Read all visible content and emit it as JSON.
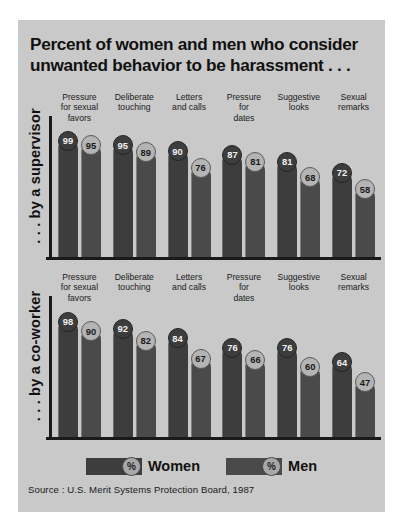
{
  "title": {
    "line1": "Percent of women and men who consider",
    "line2": "unwanted behavior to be harassment . . ."
  },
  "legend": {
    "women": {
      "label": "Women",
      "symbol": "%",
      "color": "#3d3d3d"
    },
    "men": {
      "label": "Men",
      "symbol": "%",
      "color": "#4a4a4a"
    }
  },
  "source": "Source : U.S. Merit Systems Protection Board, 1987",
  "panels": {
    "supervisor": {
      "axis_label": ". . . by a supervisor"
    },
    "coworker": {
      "axis_label": ". . . by a co-worker"
    }
  },
  "categories": [
    {
      "l1": "Pressure",
      "l2": "for sexual",
      "l3": "favors"
    },
    {
      "l1": "Deliberate",
      "l2": "touching",
      "l3": ""
    },
    {
      "l1": "Letters",
      "l2": "and calls",
      "l3": ""
    },
    {
      "l1": "Pressure",
      "l2": "for",
      "l3": "dates"
    },
    {
      "l1": "Suggestive",
      "l2": "looks",
      "l3": ""
    },
    {
      "l1": "Sexual",
      "l2": "remarks",
      "l3": ""
    }
  ],
  "chart_data": {
    "type": "bar",
    "title": "Percent of women and men who consider unwanted behavior to be harassment . . .",
    "xlabel": "",
    "ylabel": "Percent",
    "ylim": [
      0,
      100
    ],
    "grid": false,
    "legend_position": "bottom",
    "source": "Source : U.S. Merit Systems Protection Board, 1987",
    "panels": [
      {
        "name": ". . . by a supervisor",
        "categories": [
          "Pressure for sexual favors",
          "Deliberate touching",
          "Letters and calls",
          "Pressure for dates",
          "Suggestive looks",
          "Sexual remarks"
        ],
        "series": [
          {
            "name": "Women",
            "values": [
              99,
              95,
              90,
              87,
              81,
              72
            ]
          },
          {
            "name": "Men",
            "values": [
              95,
              89,
              76,
              81,
              68,
              58
            ]
          }
        ]
      },
      {
        "name": ". . . by a co-worker",
        "categories": [
          "Pressure for sexual favors",
          "Deliberate touching",
          "Letters and calls",
          "Pressure for dates",
          "Suggestive looks",
          "Sexual remarks"
        ],
        "series": [
          {
            "name": "Women",
            "values": [
              98,
              92,
              84,
              76,
              76,
              64
            ]
          },
          {
            "name": "Men",
            "values": [
              90,
              82,
              67,
              66,
              60,
              47
            ]
          }
        ]
      }
    ]
  }
}
